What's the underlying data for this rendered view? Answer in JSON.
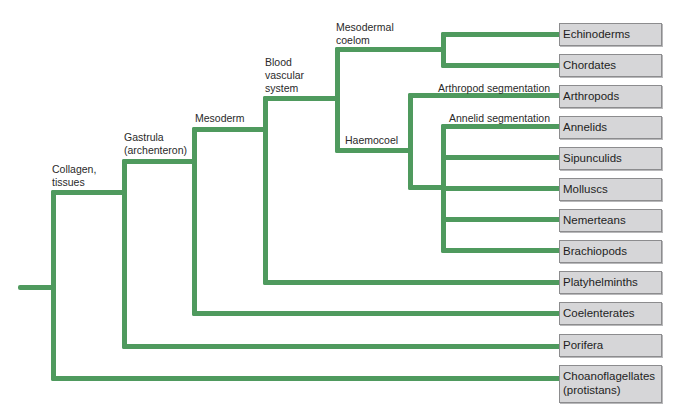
{
  "diagram": {
    "type": "phylogenetic-tree",
    "line_color": "#4f9a5e",
    "box_fill": "#d6d6d8",
    "nodes": {
      "collagen": {
        "line1": "Collagen,",
        "line2": "tissues"
      },
      "gastrula": {
        "line1": "Gastrula",
        "line2": "(archenteron)"
      },
      "mesoderm": {
        "line1": "Mesoderm"
      },
      "blood": {
        "line1": "Blood",
        "line2": "vascular",
        "line3": "system"
      },
      "coelom": {
        "line1": "Mesodermal",
        "line2": "coelom"
      },
      "haemocoel": {
        "line1": "Haemocoel"
      },
      "arthropod_seg": {
        "line1": "Arthropod segmentation"
      },
      "annelid_seg": {
        "line1": "Annelid segmentation"
      }
    },
    "taxa": [
      {
        "label": "Echinoderms"
      },
      {
        "label": "Chordates"
      },
      {
        "label": "Arthropods"
      },
      {
        "label": "Annelids"
      },
      {
        "label": "Sipunculids"
      },
      {
        "label": "Molluscs"
      },
      {
        "label": "Nemerteans"
      },
      {
        "label": "Brachiopods"
      },
      {
        "label": "Platyhelminths"
      },
      {
        "label": "Coelenterates"
      },
      {
        "label": "Porifera"
      },
      {
        "label": "Choanoflagellates",
        "label2": "(protistans)"
      }
    ]
  }
}
